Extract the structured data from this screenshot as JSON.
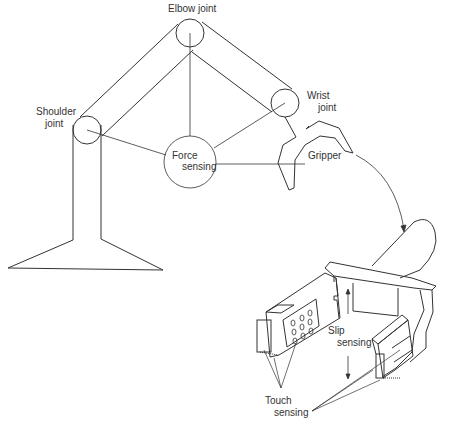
{
  "diagram": {
    "type": "robot-arm-sensing",
    "labels": {
      "elbow": "Elbow joint",
      "shoulder_1": "Shoulder",
      "shoulder_2": "joint",
      "wrist_1": "Wrist",
      "wrist_2": "joint",
      "force_1": "Force",
      "force_2": "sensing",
      "gripper": "Gripper",
      "slip_1": "Slip",
      "slip_2": "sensing",
      "touch_1": "Touch",
      "touch_2": "sensing"
    },
    "colors": {
      "line": "#333333",
      "background": "#ffffff"
    }
  }
}
